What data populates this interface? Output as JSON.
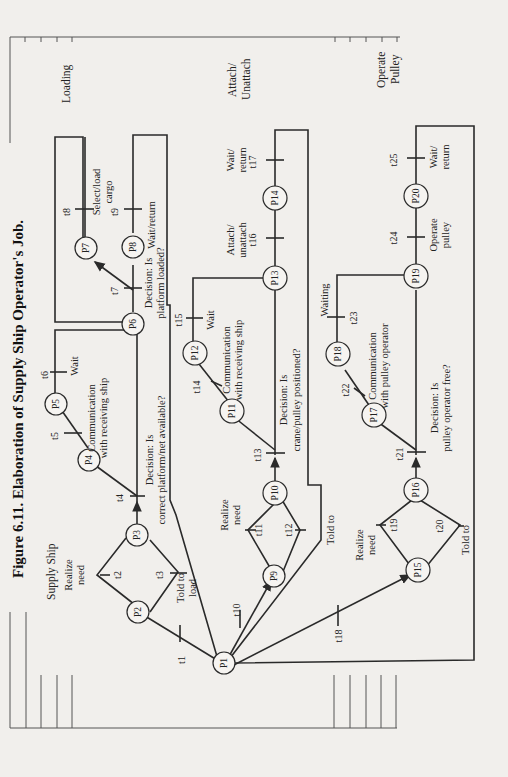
{
  "figure": {
    "title": "Figure 6.11. Elaboration of Supply Ship Operator's Job.",
    "orientation": "rotated 90° counter-clockwise"
  },
  "sections": {
    "supply_ship": "Supply Ship",
    "loading": "Loading",
    "attach_unattach_1": "Attach/",
    "attach_unattach_2": "Unattach",
    "operate_pulley_1": "Operate",
    "operate_pulley_2": "Pulley"
  },
  "places": {
    "p1": "P1",
    "p2": "P2",
    "p3": "P3",
    "p4": "P4",
    "p5": "P5",
    "p6": "P6",
    "p7": "P7",
    "p8": "P8",
    "p9": "P9",
    "p10": "P10",
    "p11": "P11",
    "p12": "P12",
    "p13": "P13",
    "p14": "P14",
    "p15": "P15",
    "p16": "P16",
    "p17": "P17",
    "p18": "P18",
    "p19": "P19",
    "p20": "P20"
  },
  "transitions": {
    "t1": "t1",
    "t2": "t2",
    "t3": "t3",
    "t4": "t4",
    "t5": "t5",
    "t6": "t6",
    "t7": "t7",
    "t8": "t8",
    "t9": "t9",
    "t10": "t10",
    "t11": "t11",
    "t12": "t12",
    "t13": "t13",
    "t14": "t14",
    "t15": "t15",
    "t16": "t16",
    "t17": "t17",
    "t18": "t18",
    "t19": "t19",
    "t20": "t20",
    "t21": "t21",
    "t22": "t22",
    "t23": "t23",
    "t24": "t24",
    "t25": "t25"
  },
  "labels": {
    "realize_need_1a": "Realize",
    "realize_need_1b": "need",
    "told_to_load_a": "Told to",
    "told_to_load_b": "load",
    "decision_platform_a": "Decision: Is",
    "decision_platform_b": "correct platform/net available?",
    "comm_receiving_1a": "Communication",
    "comm_receiving_1b": "with receiving ship",
    "wait_1": "Wait",
    "decision_loaded_a": "Decision: Is",
    "decision_loaded_b": "platform loaded?",
    "select_load_a": "Select/load",
    "select_load_b": "cargo",
    "wait_return_1": "Wait/return",
    "realize_need_2a": "Realize",
    "realize_need_2b": "need",
    "told_to_2": "Told to",
    "decision_crane_a": "Decision: Is",
    "decision_crane_b": "crane/pulley positioned?",
    "comm_receiving_2a": "Communication",
    "comm_receiving_2b": "with receiving ship",
    "wait_2": "Wait",
    "attach_a": "Attach/",
    "attach_b": "unattach",
    "wait_return_2a": "Wait/",
    "wait_return_2b": "return",
    "realize_need_3a": "Realize",
    "realize_need_3b": "need",
    "told_to_3": "Told to",
    "decision_pulley_a": "Decision: Is",
    "decision_pulley_b": "pulley operator free?",
    "comm_pulley_a": "Communication",
    "comm_pulley_b": "with pulley operator",
    "waiting": "Waiting",
    "operate_pulley_a": "Operate",
    "operate_pulley_b": "pulley",
    "wait_return_3a": "Wait/",
    "wait_return_3b": "return"
  },
  "colors": {
    "paper": "#f1efec",
    "ink": "#2a2a2a"
  }
}
